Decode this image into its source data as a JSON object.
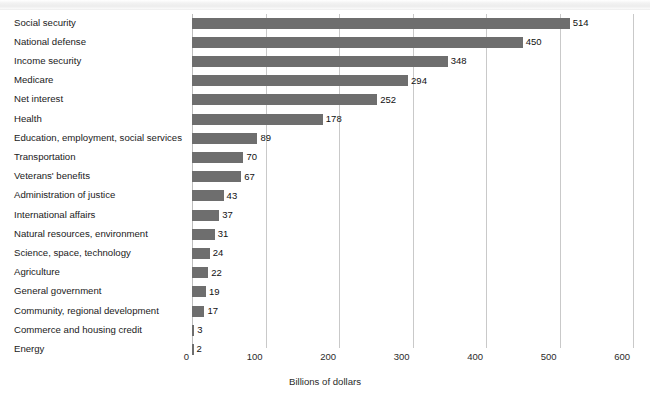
{
  "figure": {
    "top_band_text": "",
    "background_color": "#ffffff",
    "bar_color": "#6e6e6e",
    "gridline_color": "#c9c9c9",
    "text_color": "#1a1a1a"
  },
  "chart_data": {
    "type": "bar",
    "orientation": "horizontal",
    "title": "",
    "subtitle": "",
    "xlabel": "Billions of dollars",
    "ylabel": "",
    "xlim": [
      0,
      600
    ],
    "xticks": [
      0,
      100,
      200,
      300,
      400,
      500,
      600
    ],
    "xtick_labels": [
      "0",
      "100",
      "200",
      "300",
      "400",
      "500",
      "600"
    ],
    "grid": "vertical",
    "legend": "none",
    "value_labels": true,
    "categories": [
      "Social security",
      "National defense",
      "Income security",
      "Medicare",
      "Net interest",
      "Health",
      "Education, employment, social services",
      "Transportation",
      "Veterans' benefits",
      "Administration of justice",
      "International affairs",
      "Natural resources, environment",
      "Science, space, technology",
      "Agriculture",
      "General government",
      "Community, regional development",
      "Commerce and housing credit",
      "Energy"
    ],
    "values": [
      514,
      450,
      348,
      294,
      252,
      178,
      89,
      70,
      67,
      43,
      37,
      31,
      24,
      22,
      19,
      17,
      3,
      2
    ],
    "value_label_text": [
      "514",
      "450",
      "348",
      "294",
      "252",
      "178",
      "89",
      "70",
      "67",
      "43",
      "37",
      "31",
      "24",
      "22",
      "19",
      "17",
      "3",
      "2"
    ]
  }
}
